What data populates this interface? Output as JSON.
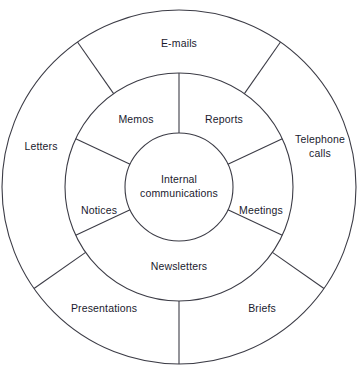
{
  "diagram": {
    "type": "concentric-ring-wheel",
    "center": {
      "line1": "Internal",
      "line2": "communications"
    },
    "inner_ring": {
      "segment_count": 6,
      "segments": [
        {
          "label": "Reports",
          "angle_deg": 57
        },
        {
          "label": "Meetings",
          "angle_deg": 352
        },
        {
          "label": "Newsletters",
          "angle_deg": 270
        },
        {
          "label": "Notices",
          "angle_deg": 189
        },
        {
          "label": "Memos",
          "angle_deg": 123
        }
      ],
      "divider_angles_deg": [
        90,
        25,
        155,
        205,
        335
      ]
    },
    "outer_ring": {
      "segment_count": 6,
      "segments": [
        {
          "label": "E-mails",
          "angle_deg": 90
        },
        {
          "label": "Telephone calls",
          "label_line1": "Telephone",
          "label_line2": "calls",
          "angle_deg": 22
        },
        {
          "label": "Briefs",
          "angle_deg": 310
        },
        {
          "label": "Presentations",
          "angle_deg": 232
        },
        {
          "label": "Letters",
          "angle_deg": 160
        }
      ],
      "divider_angles_deg": [
        55,
        125,
        215,
        270,
        325
      ]
    },
    "geometry": {
      "center_x": 179,
      "center_y": 187,
      "inner_radius": 54,
      "middle_radius": 114,
      "outer_radius": 177
    },
    "colors": {
      "stroke": "#3c3c46",
      "text": "#1a1a2e",
      "background": "#ffffff"
    }
  }
}
